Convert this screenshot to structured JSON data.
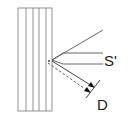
{
  "diagram": {
    "labels": {
      "s_prime": "S'",
      "d": "D"
    },
    "colors": {
      "stroke": "#555555",
      "text": "#1a1a1a",
      "background": "#ffffff"
    }
  }
}
